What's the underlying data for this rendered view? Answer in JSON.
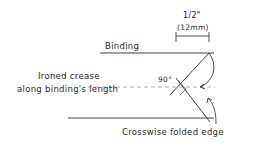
{
  "diagram": {
    "labels": {
      "measure_top": "1/2\"",
      "measure_bottom": "(12mm)",
      "binding": "Binding",
      "crease_line1": "Ironed crease",
      "crease_line2": "along binding's length",
      "angle": "90°",
      "folded_edge": "Crosswise folded edge"
    },
    "colors": {
      "ink": "#2a2a2a",
      "dashed": "#9a9a9a",
      "background": "#ffffff"
    }
  }
}
